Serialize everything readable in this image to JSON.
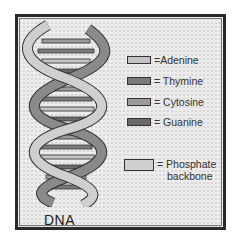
{
  "figure": {
    "title_label": "DNA",
    "caption_text": "",
    "colors": {
      "frame_border": "#2a2a2a",
      "frame_background": "#ececec",
      "adenine": "#c4c4c4",
      "thymine": "#7a7a7a",
      "cytosine": "#9a9a9a",
      "guanine": "#6a6a6a",
      "phosphate_backbone": "#cfcfcf",
      "backbone_back_strand": "#8a8a8a"
    }
  },
  "legend": {
    "items": [
      {
        "label": "=Adenine"
      },
      {
        "label": "= Thymine"
      },
      {
        "label": "= Cytosine"
      },
      {
        "label": "= Guanine"
      }
    ],
    "backbone": {
      "label_line1": "= Phosphate",
      "label_line2": "backbone"
    }
  }
}
